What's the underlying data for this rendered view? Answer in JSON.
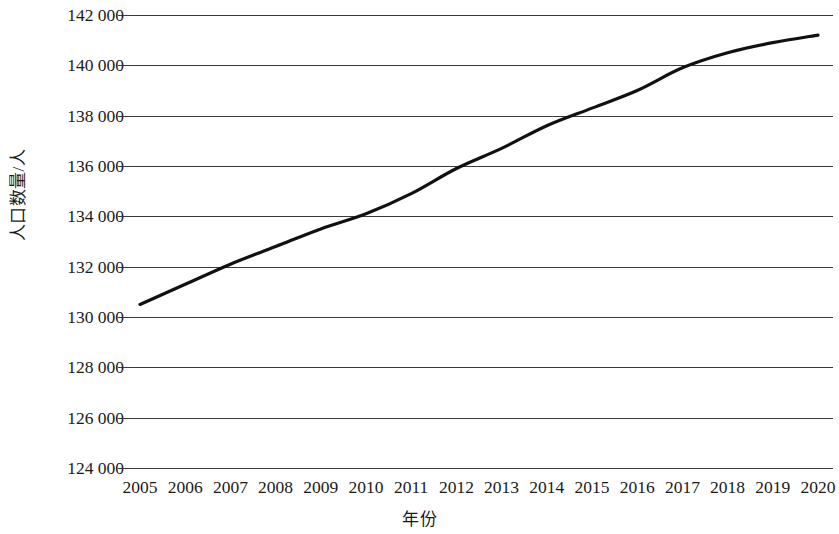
{
  "chart_data": {
    "type": "line",
    "title": "",
    "xlabel": "年份",
    "ylabel": "人口数量/人",
    "x": [
      2005,
      2006,
      2007,
      2008,
      2009,
      2010,
      2011,
      2012,
      2013,
      2014,
      2015,
      2016,
      2017,
      2018,
      2019,
      2020
    ],
    "categories": [
      "2005",
      "2006",
      "2007",
      "2008",
      "2009",
      "2010",
      "2011",
      "2012",
      "2013",
      "2014",
      "2015",
      "2016",
      "2017",
      "2018",
      "2019",
      "2020"
    ],
    "series": [
      {
        "name": "人口数量",
        "values": [
          130500,
          131300,
          132100,
          132800,
          133500,
          134100,
          134900,
          135900,
          136700,
          137600,
          138300,
          139000,
          139900,
          140500,
          140900,
          141200
        ]
      }
    ],
    "values": [
      130500,
      131300,
      132100,
      132800,
      133500,
      134100,
      134900,
      135900,
      136700,
      137600,
      138300,
      139000,
      139900,
      140500,
      140900,
      141200
    ],
    "ylim": [
      124000,
      142000
    ],
    "ytick_values": [
      142000,
      140000,
      138000,
      136000,
      134000,
      132000,
      130000,
      128000,
      126000,
      124000
    ],
    "ytick_labels": [
      "142 000",
      "140 000",
      "138 000",
      "136 000",
      "134 000",
      "132 000",
      "130 000",
      "128 000",
      "126 000",
      "124 000"
    ],
    "xlim": [
      2005,
      2020
    ],
    "grid": "horizontal",
    "legend": "none",
    "line_color": "#111111",
    "grid_color": "#3a3a3a",
    "background_color": "#ffffff"
  }
}
